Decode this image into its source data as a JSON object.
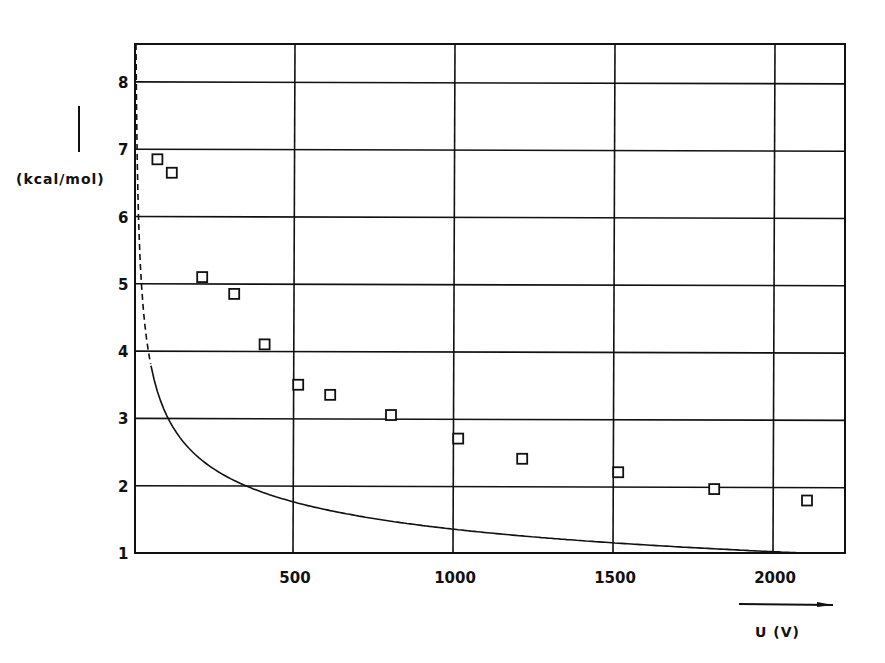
{
  "chart_data": {
    "type": "scatter",
    "title": "",
    "xlabel": "U (V)",
    "ylabel": "(kcal/mol)",
    "xlim": [
      0,
      2200
    ],
    "ylim": [
      1,
      8.6
    ],
    "x_ticks": [
      500,
      1000,
      1500,
      2000
    ],
    "x_tick_labels": [
      "500",
      "1000",
      "1500",
      "2000"
    ],
    "y_ticks": [
      1,
      2,
      3,
      4,
      5,
      6,
      7,
      8
    ],
    "y_tick_labels": [
      "1",
      "2",
      "3",
      "4",
      "5",
      "6",
      "7",
      "8"
    ],
    "grid": true,
    "legend": null,
    "series": [
      {
        "name": "measured",
        "marker": "open-square",
        "x": [
          70,
          115,
          210,
          310,
          405,
          510,
          610,
          800,
          1010,
          1210,
          1510,
          1810,
          2100
        ],
        "y": [
          6.85,
          6.65,
          5.1,
          4.85,
          4.1,
          3.5,
          3.35,
          3.05,
          2.7,
          2.4,
          2.2,
          1.95,
          1.78
        ]
      },
      {
        "name": "fit curve",
        "style": "solid line (dashed extrapolation near U→0)",
        "x": [
          0,
          50,
          100,
          200,
          300,
          400,
          500,
          750,
          1000,
          1500,
          1700,
          2100
        ],
        "y": [
          8.6,
          7.0,
          6.3,
          5.2,
          4.55,
          4.05,
          3.65,
          2.95,
          2.55,
          2.05,
          1.92,
          1.72
        ]
      }
    ],
    "annotations": [
      "arrow along y-axis label pointing up",
      "arrow under x-axis pointing right"
    ]
  },
  "axes": {
    "ylabel": "(kcal/mol)",
    "xlabel": "U (V)"
  }
}
